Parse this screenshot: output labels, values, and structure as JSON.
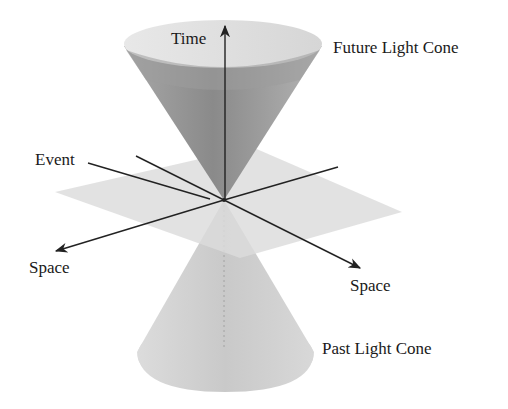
{
  "diagram": {
    "labels": {
      "time": "Time",
      "future_light_cone": "Future Light Cone",
      "event": "Event",
      "space_left": "Space",
      "space_right": "Space",
      "past_light_cone": "Past Light Cone"
    },
    "colors": {
      "background": "#ffffff",
      "future_cone_inner": "#8f8f8f",
      "future_cone_rim": "#e6e6e6",
      "plane": "#dcdcdc",
      "past_cone": "#d2d2d2",
      "axis_line": "#222222",
      "text": "#1a1a1a"
    },
    "elements": [
      {
        "id": "future-light-cone",
        "shape": "cone",
        "orientation": "up"
      },
      {
        "id": "past-light-cone",
        "shape": "cone",
        "orientation": "down"
      },
      {
        "id": "space-plane",
        "shape": "plane"
      },
      {
        "id": "time-axis",
        "shape": "arrow",
        "direction": "up"
      },
      {
        "id": "space-axis-left",
        "shape": "arrow",
        "direction": "down-left"
      },
      {
        "id": "space-axis-right",
        "shape": "arrow",
        "direction": "down-right"
      },
      {
        "id": "event-pointer",
        "shape": "line",
        "points_to": "apex"
      }
    ]
  }
}
